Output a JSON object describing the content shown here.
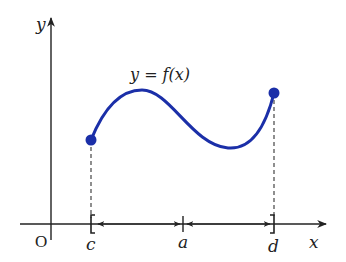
{
  "diagram": {
    "curve_label": "y = f(x)",
    "axis_labels": {
      "x": "x",
      "y": "y",
      "origin": "O"
    },
    "points": {
      "c": "c",
      "a": "a",
      "d": "d"
    },
    "colors": {
      "curve": "#1b2fa8",
      "axes": "#222222",
      "dash": "#333333"
    }
  }
}
